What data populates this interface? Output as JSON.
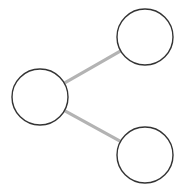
{
  "diagram": {
    "type": "tree",
    "colors": {
      "background": "#ffffff",
      "node_stroke": "#333333",
      "node_fill": "#ffffff",
      "edge_stroke": "#b3b3b3"
    },
    "nodes": [
      {
        "id": "root",
        "label": "",
        "cx": 40,
        "cy": 97,
        "r": 28
      },
      {
        "id": "child-top",
        "label": "",
        "cx": 145,
        "cy": 37,
        "r": 28
      },
      {
        "id": "child-bottom",
        "label": "",
        "cx": 145,
        "cy": 155,
        "r": 28
      }
    ],
    "edges": [
      {
        "from": "root",
        "to": "child-top"
      },
      {
        "from": "root",
        "to": "child-bottom"
      }
    ]
  }
}
